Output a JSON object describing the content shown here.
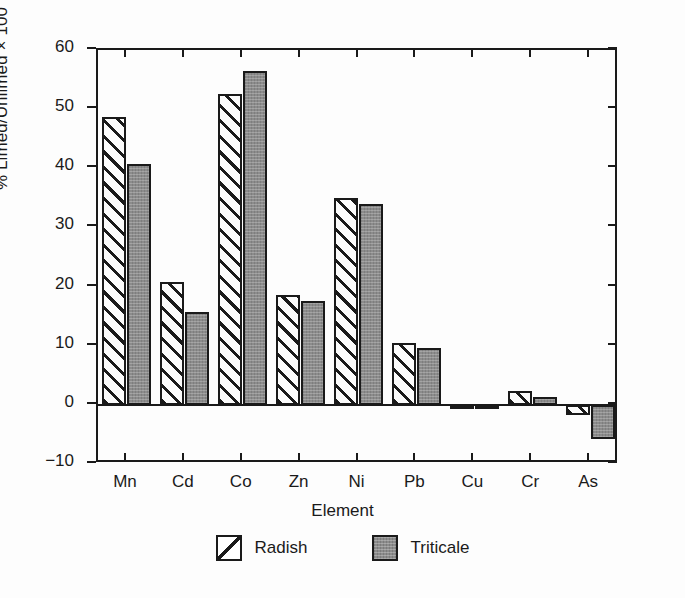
{
  "chart_data": {
    "type": "bar",
    "title": "",
    "xlabel": "Element",
    "ylabel": "% Limed/Unlimed × 100",
    "ylim": [
      -10,
      60
    ],
    "yticks": [
      60,
      50,
      40,
      30,
      20,
      10,
      0,
      -10
    ],
    "ytick_labels": [
      "60",
      "50",
      "40",
      "30",
      "20",
      "10",
      "0",
      "−10"
    ],
    "grid": false,
    "legend_position": "bottom-center",
    "categories": [
      "Mn",
      "Cd",
      "Co",
      "Zn",
      "Ni",
      "Pb",
      "Cu",
      "Cr",
      "As"
    ],
    "series": [
      {
        "name": "Radish",
        "fill": "diagonal-hatch",
        "color": "#ffffff",
        "values": [
          48.7,
          20.7,
          52.5,
          18.5,
          35.0,
          10.5,
          -0.6,
          2.4,
          -1.7
        ]
      },
      {
        "name": "Triticale",
        "fill": "solid-gray",
        "color": "#8c8c8c",
        "values": [
          40.8,
          15.7,
          56.5,
          17.6,
          34.0,
          9.6,
          -0.5,
          1.3,
          -5.7
        ]
      }
    ]
  },
  "axes": {
    "y_label": "% Limed/Unlimed × 100",
    "x_label": "Element"
  },
  "legend": {
    "entries": [
      {
        "label": "Radish"
      },
      {
        "label": "Triticale"
      }
    ]
  }
}
